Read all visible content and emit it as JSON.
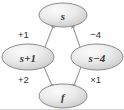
{
  "diagram": {
    "background_color": "#fefefe",
    "node_stroke_color": "#8c8c8c",
    "node_fill_light": "#f2f2f2",
    "node_fill_dark": "#c9c9c9",
    "edge_color": "#9a9a9a",
    "text_color": "#3a3a3a",
    "nodes": [
      {
        "id": "top",
        "label": "s",
        "cx": 63,
        "cy": 15,
        "rx": 24,
        "ry": 12
      },
      {
        "id": "left",
        "label": "s+1",
        "cx": 28,
        "cy": 57,
        "rx": 26,
        "ry": 13
      },
      {
        "id": "right",
        "label": "s−4",
        "cx": 97,
        "cy": 57,
        "rx": 26,
        "ry": 13
      },
      {
        "id": "bottom",
        "label": "f",
        "cx": 63,
        "cy": 96,
        "rx": 24,
        "ry": 12
      }
    ],
    "edges": [
      {
        "id": "left-to-top",
        "from": "left",
        "to": "top",
        "label": "+1",
        "label_x": 18,
        "label_y": 34
      },
      {
        "id": "right-to-top",
        "from": "right",
        "to": "top",
        "label": "−4",
        "label_x": 89,
        "label_y": 34
      },
      {
        "id": "left-to-bottom",
        "from": "left",
        "to": "bottom",
        "label": "+2",
        "label_x": 18,
        "label_y": 79
      },
      {
        "id": "right-to-bottom",
        "from": "right",
        "to": "bottom",
        "label": "×1",
        "label_x": 89,
        "label_y": 79
      }
    ]
  }
}
